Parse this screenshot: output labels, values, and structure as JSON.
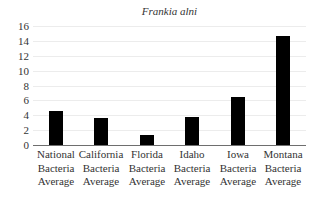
{
  "chart_data": {
    "type": "bar",
    "title": "Frankia alni",
    "xlabel": "",
    "ylabel": "",
    "ylim": [
      0,
      16
    ],
    "yticks": [
      0,
      2,
      4,
      6,
      8,
      10,
      12,
      14,
      16
    ],
    "grid": true,
    "legend": null,
    "bar_color": "#000000",
    "categories": [
      "National Bacteria Average",
      "California Bacteria Average",
      "Florida Bacteria Average",
      "Idaho Bacteria Average",
      "Iowa Bacteria Average",
      "Montana Bacteria Average"
    ],
    "category_lines": [
      [
        "National",
        "Bacteria",
        "Average"
      ],
      [
        "California",
        "Bacteria",
        "Average"
      ],
      [
        "Florida",
        "Bacteria",
        "Average"
      ],
      [
        "Idaho",
        "Bacteria",
        "Average"
      ],
      [
        "Iowa",
        "Bacteria",
        "Average"
      ],
      [
        "Montana",
        "Bacteria",
        "Average"
      ]
    ],
    "values": [
      4.6,
      3.6,
      1.4,
      3.8,
      6.4,
      14.6
    ]
  }
}
